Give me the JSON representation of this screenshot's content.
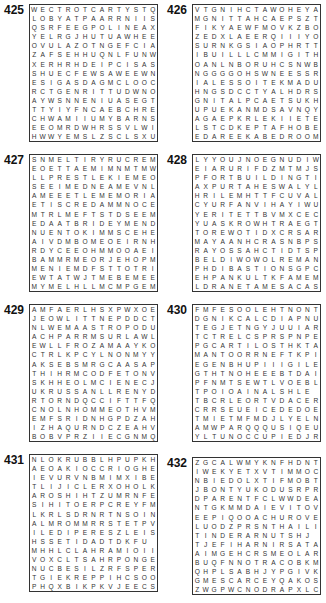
{
  "puzzles": [
    {
      "number": "425",
      "rows": [
        "WECTROTCARTYSTQ",
        "LOBYATPAARRNIIS",
        "QSRFEEGPOLINEAX",
        "YELRGJHUTUAWHEE",
        "OVULAZOTNGEFCIA",
        "ZAFSEHHUQNLFUNW",
        "XERHRHDEIPCISAS",
        "SHUECFEWSAWEEWN",
        "ESIGASDAGMCLOOC",
        "RCTGENRITTUDWNO",
        "AYWSNNENIUASEGT",
        "TTYIYFNCAEBCHRE",
        "CHWAMIIUMYBARNS",
        "EEOMRDWHRSSVLWI",
        "HWWYEMSLZSCLSXU"
      ]
    },
    {
      "number": "426",
      "rows": [
        "VTGNIHCTAWOHEYA",
        "MGNITTAHCAEPSZT",
        "FIKYAEWFMOVKZBO",
        "ZEDXLAEERQIIIYO",
        "SURNKGSIAOPHRTT",
        "IBUILLLCMMIGITH",
        "OANLNBORUHCSNWB",
        "NGGGGOHSWNEESSR",
        "IALESSOITEKMADU",
        "HNGSDCCTYALHDRS",
        "GNITALPCAETSUKH",
        "UPUEKANMDSAVNQY",
        "AGAEPKRLEKIIETE",
        "LSTCDKEPTAFHOBE",
        "EDAREEKABEDROOMR"
      ]
    },
    {
      "number": "427",
      "rows": [
        "SNMELTIRYRUCREM",
        "EOETTAEMIMNMTMW",
        "LLPRESTLEKIEMEO",
        "SEEIMEDNEAMEVNL",
        "AMEEETLEMEMORIAL",
        "ETISCREDAMMNOCE",
        "MTRLMEFTSTDSEEM",
        "EDAATBRIDEYMEND",
        "NUENTOKIMMSCEHE",
        "AIVDMBOMEOEIRNH",
        "RDYCEEOHMMOOAEI",
        "BAMMRMEORJEHOPM",
        "MENIEMDFSTTOTRI",
        "EWTATWJTMEBEMEE",
        "MYMELHLLMCMPGEM"
      ]
    },
    {
      "number": "428",
      "rows": [
        "LYYOUJNOEGNUDIW",
        "EIARURIFDZMTMJS",
        "PFORTBUILDINGTI",
        "AXPURTAHESWALYL",
        "HRILEMHTTFCUVAL",
        "CYURFANVIHAYIWU",
        "YERITETTBVMXCEC",
        "YUASKROWHTRAEGT",
        "TOREWOTIDXCRSAR",
        "MAYAANHCRASNBPS",
        "RAYOSSAHCTIDTSP",
        "BELDIWOWOLREMAN",
        "PHDIBASTIONSGPC",
        "EHPANKULTKFAMEM",
        "LDRANETAMESACAS"
      ]
    },
    {
      "number": "429",
      "rows": [
        "AMFAERLHSXPWXOE",
        "JEOWLITTNEPDDCT",
        "NLWEMAASTROPODU",
        "ACHPARRMSURLAWL",
        "EWLLFROZAMAAYKO",
        "CTRLKPCYLNONMYY",
        "AKSEBSMRGCAASAP",
        "THIHRMCODFETONV",
        "SKHHEOLMCIENECJ",
        "UKRUSSANLLRENYD",
        "RTORNDQCCIFTTFQ",
        "CNOLNHOMMEOTHVM",
        "EMFSRIDNHGPDZAH",
        "IZHAQURNDCZEAHV",
        "BOBVPRZIIECGNMQ"
      ]
    },
    {
      "number": "430",
      "rows": [
        "FMFESOOLEHTNONT",
        "DGNIKCALCDIAPNU",
        "TEGJETNGYJUUIAR",
        "TCTRELCSPRSPNPE",
        "PGCARTILOSTHKTAV",
        "MANTOORRNEFTKPI",
        "EGENBHUPIIIGILE",
        "GTHTNOHEEEBTDAI",
        "PFNMTSEWTLVOEBL",
        "TPOIOAINALSHLE",
        "TBCRLEORTVDACER",
        "CRRSEUEICEDEDOE",
        "TMIETMFMDJLYELN",
        "AMWPARQQQUSIQEU",
        "YLTUNOCCUPIEDJR"
      ]
    },
    {
      "number": "431",
      "rows": [
        "NLOKRUBBLHPUPKHL",
        "AEOAKIOCCRIOGHEA",
        "IEVURVNBMIMXIBE",
        "TLIJICLERXOHOLK",
        "AROSHIHTZUMRNFE",
        "SIHITOERPCREYFMN",
        "LKRLSDRNRTNSOINGO",
        "ALMROMMRRSTETPVI",
        "ILEDIPERESZLEIS",
        "HSSETIDADTDKFU",
        "MHHLCLAHRAMIOIIR",
        "VOXCLTSAHRPONGE",
        "NUCBESILZRFSPERX",
        "TGIEKREPPIHCSOO",
        "PHQXBIKPKVJEECS"
      ]
    },
    {
      "number": "432",
      "rows": [
        "ZGCALWMYKNFHDNT",
        "IWEKYETXVTIMMOC",
        "NBIEDOLXTIFMOBT",
        "JBONTYUKODUSRPR",
        "DPARENTFCLWWDEA",
        "NTGKMMDAIEVITOV",
        "EEPIQOOACHUROVE",
        "LUODZPRSNTHAILIVL",
        "TINDERARNUTSHJ",
        "TJEFIHARNIRSATAL",
        "AIMGEHCRSMEOLAR",
        "BUQFNNOTRACOBKM",
        "QHPLSABHJYPGIVK",
        "GMESCARCEYQAKOS",
        "ZWGPWCNODRAPXLC"
      ]
    }
  ]
}
